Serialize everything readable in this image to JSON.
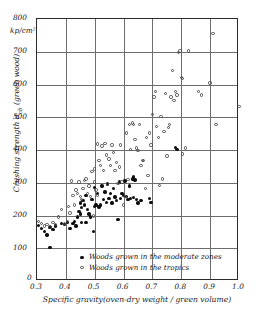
{
  "chart_data": {
    "type": "scatter",
    "title": "",
    "xlabel": "Specific gravity(oven-dry weight / green volume)",
    "ylabel": "Crushing strength σcb (green wood)",
    "yunit": "kp/cm²",
    "xlim": [
      0.3,
      1.0
    ],
    "ylim": [
      0,
      800
    ],
    "origin_label": "0",
    "grid": true,
    "xticks": [
      "0.3",
      "0.4",
      "0.5",
      "0.6",
      "0.7",
      "0.8",
      "0.9",
      "1.0"
    ],
    "xtick_values": [
      0.3,
      0.4,
      0.5,
      0.6,
      0.7,
      0.8,
      0.9,
      1.0
    ],
    "yticks": [
      "100",
      "200",
      "300",
      "400",
      "500",
      "600",
      "700",
      "800"
    ],
    "ytick_values": [
      100,
      200,
      300,
      400,
      500,
      600,
      700,
      800
    ],
    "legend_position": "bottom-center",
    "series": [
      {
        "name": "Woods grown in the moderate zones",
        "marker": "filled-circle",
        "color": "#0d0d0d",
        "points": [
          [
            0.305,
            170
          ],
          [
            0.315,
            160
          ],
          [
            0.325,
            152
          ],
          [
            0.335,
            140
          ],
          [
            0.345,
            103
          ],
          [
            0.345,
            163
          ],
          [
            0.355,
            158
          ],
          [
            0.365,
            168
          ],
          [
            0.385,
            176
          ],
          [
            0.395,
            172
          ],
          [
            0.405,
            178
          ],
          [
            0.415,
            160
          ],
          [
            0.425,
            175
          ],
          [
            0.43,
            182
          ],
          [
            0.435,
            168
          ],
          [
            0.44,
            196
          ],
          [
            0.445,
            212
          ],
          [
            0.45,
            205
          ],
          [
            0.45,
            238
          ],
          [
            0.455,
            178
          ],
          [
            0.455,
            225
          ],
          [
            0.46,
            246
          ],
          [
            0.465,
            232
          ],
          [
            0.47,
            178
          ],
          [
            0.47,
            262
          ],
          [
            0.475,
            218
          ],
          [
            0.48,
            205
          ],
          [
            0.485,
            196
          ],
          [
            0.49,
            248
          ],
          [
            0.495,
            152
          ],
          [
            0.5,
            228
          ],
          [
            0.5,
            285
          ],
          [
            0.505,
            232
          ],
          [
            0.51,
            268
          ],
          [
            0.515,
            226
          ],
          [
            0.52,
            232
          ],
          [
            0.525,
            290
          ],
          [
            0.53,
            248
          ],
          [
            0.535,
            272
          ],
          [
            0.54,
            240
          ],
          [
            0.545,
            296
          ],
          [
            0.55,
            252
          ],
          [
            0.555,
            268
          ],
          [
            0.56,
            238
          ],
          [
            0.565,
            282
          ],
          [
            0.57,
            256
          ],
          [
            0.575,
            246
          ],
          [
            0.58,
            188
          ],
          [
            0.585,
            302
          ],
          [
            0.59,
            252
          ],
          [
            0.595,
            268
          ],
          [
            0.6,
            262
          ],
          [
            0.605,
            305
          ],
          [
            0.61,
            258
          ],
          [
            0.615,
            248
          ],
          [
            0.62,
            290
          ],
          [
            0.625,
            252
          ],
          [
            0.63,
            312
          ],
          [
            0.635,
            318
          ],
          [
            0.635,
            255
          ],
          [
            0.64,
            308
          ],
          [
            0.645,
            248
          ],
          [
            0.65,
            238
          ],
          [
            0.66,
            245
          ],
          [
            0.69,
            252
          ],
          [
            0.695,
            240
          ],
          [
            0.78,
            408
          ],
          [
            0.785,
            402
          ]
        ]
      },
      {
        "name": "Woods grown in the tropics",
        "marker": "open-circle",
        "color": "#4a4a4a",
        "points": [
          [
            0.305,
            182
          ],
          [
            0.315,
            176
          ],
          [
            0.325,
            168
          ],
          [
            0.335,
            172
          ],
          [
            0.345,
            165
          ],
          [
            0.355,
            178
          ],
          [
            0.365,
            172
          ],
          [
            0.375,
            196
          ],
          [
            0.385,
            218
          ],
          [
            0.395,
            176
          ],
          [
            0.405,
            182
          ],
          [
            0.41,
            228
          ],
          [
            0.415,
            208
          ],
          [
            0.42,
            305
          ],
          [
            0.425,
            262
          ],
          [
            0.43,
            232
          ],
          [
            0.435,
            278
          ],
          [
            0.44,
            268
          ],
          [
            0.445,
            302
          ],
          [
            0.45,
            258
          ],
          [
            0.455,
            248
          ],
          [
            0.46,
            282
          ],
          [
            0.465,
            306
          ],
          [
            0.47,
            312
          ],
          [
            0.475,
            268
          ],
          [
            0.48,
            290
          ],
          [
            0.485,
            258
          ],
          [
            0.49,
            335
          ],
          [
            0.495,
            198
          ],
          [
            0.5,
            302
          ],
          [
            0.5,
            342
          ],
          [
            0.505,
            278
          ],
          [
            0.51,
            418
          ],
          [
            0.51,
            262
          ],
          [
            0.515,
            368
          ],
          [
            0.52,
            352
          ],
          [
            0.525,
            412
          ],
          [
            0.53,
            338
          ],
          [
            0.535,
            420
          ],
          [
            0.54,
            385
          ],
          [
            0.545,
            296
          ],
          [
            0.55,
            372
          ],
          [
            0.555,
            352
          ],
          [
            0.56,
            415
          ],
          [
            0.565,
            392
          ],
          [
            0.57,
            338
          ],
          [
            0.575,
            362
          ],
          [
            0.58,
            298
          ],
          [
            0.585,
            348
          ],
          [
            0.59,
            415
          ],
          [
            0.595,
            302
          ],
          [
            0.6,
            232
          ],
          [
            0.605,
            258
          ],
          [
            0.61,
            452
          ],
          [
            0.615,
            310
          ],
          [
            0.62,
            478
          ],
          [
            0.625,
            402
          ],
          [
            0.63,
            482
          ],
          [
            0.635,
            478
          ],
          [
            0.64,
            432
          ],
          [
            0.645,
            406
          ],
          [
            0.65,
            398
          ],
          [
            0.655,
            478
          ],
          [
            0.66,
            352
          ],
          [
            0.665,
            368
          ],
          [
            0.67,
            368
          ],
          [
            0.675,
            282
          ],
          [
            0.68,
            438
          ],
          [
            0.685,
            322
          ],
          [
            0.69,
            452
          ],
          [
            0.695,
            415
          ],
          [
            0.7,
            508
          ],
          [
            0.705,
            562
          ],
          [
            0.71,
            578
          ],
          [
            0.715,
            472
          ],
          [
            0.72,
            438
          ],
          [
            0.725,
            292
          ],
          [
            0.73,
            502
          ],
          [
            0.735,
            312
          ],
          [
            0.74,
            456
          ],
          [
            0.745,
            572
          ],
          [
            0.75,
            382
          ],
          [
            0.755,
            468
          ],
          [
            0.76,
            478
          ],
          [
            0.765,
            562
          ],
          [
            0.77,
            642
          ],
          [
            0.775,
            552
          ],
          [
            0.78,
            578
          ],
          [
            0.785,
            568
          ],
          [
            0.79,
            698
          ],
          [
            0.795,
            702
          ],
          [
            0.8,
            622
          ],
          [
            0.805,
            618
          ],
          [
            0.805,
            388
          ],
          [
            0.815,
            406
          ],
          [
            0.825,
            702
          ],
          [
            0.86,
            578
          ],
          [
            0.87,
            568
          ],
          [
            0.9,
            605
          ],
          [
            0.91,
            755
          ],
          [
            0.92,
            478
          ],
          [
            1.0,
            532
          ]
        ]
      }
    ]
  }
}
